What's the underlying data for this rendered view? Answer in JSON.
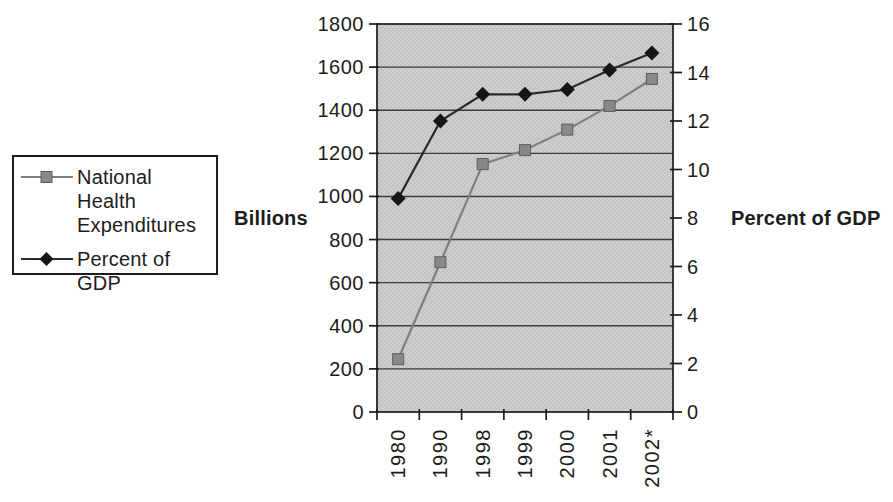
{
  "colors": {
    "background": "#ffffff",
    "plot_bg": "#cecece",
    "plot_dot": "#b8b8b8",
    "grid": "#3c3c3c",
    "axis": "#1c1c1c",
    "text": "#1c1c1c",
    "nhe_line": "#7e7e7e",
    "nhe_marker": "#888888",
    "nhe_marker_edge": "#5e5e5e",
    "gdp_line": "#2a2a2a",
    "gdp_marker": "#161616"
  },
  "legend": {
    "series1_label": "National Health Expenditures",
    "series2_label": "Percent of GDP"
  },
  "axis_titles": {
    "left": "Billions",
    "right": "Percent of GDP"
  },
  "chart_data": {
    "type": "line",
    "categories": [
      "1980",
      "1990",
      "1998",
      "1999",
      "2000",
      "2001",
      "2002*"
    ],
    "series": [
      {
        "name": "National Health Expenditures",
        "axis": "left",
        "marker": "square",
        "values": [
          245,
          695,
          1150,
          1215,
          1310,
          1420,
          1545
        ]
      },
      {
        "name": "Percent of GDP",
        "axis": "right",
        "marker": "diamond",
        "values": [
          8.8,
          12.0,
          13.1,
          13.1,
          13.3,
          14.1,
          14.8
        ]
      }
    ],
    "left_axis": {
      "label": "Billions",
      "min": 0,
      "max": 1800,
      "step": 200,
      "ticks": [
        "1800",
        "1600",
        "1400",
        "1200",
        "1000",
        "800",
        "600",
        "400",
        "200",
        "0"
      ]
    },
    "right_axis": {
      "label": "Percent of GDP",
      "min": 0,
      "max": 16,
      "step": 2,
      "ticks": [
        "16",
        "14",
        "12",
        "10",
        "8",
        "6",
        "4",
        "2",
        "0"
      ]
    },
    "grid": true,
    "legend_position": "left",
    "x_tick_style": "between-categories",
    "x_label_rotation": -90
  }
}
